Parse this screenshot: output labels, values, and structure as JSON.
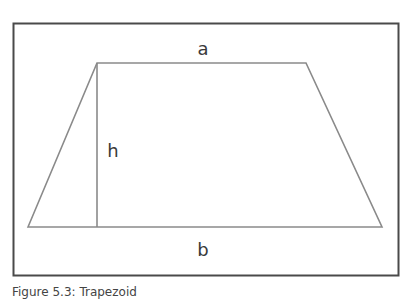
{
  "figure": {
    "title": "Trapezoid",
    "caption": "Figure 5.3: Trapezoid",
    "labels": {
      "top_side": "a",
      "height": "h",
      "bottom_side": "b"
    },
    "colors": {
      "frame": "#4a4a4a",
      "shape": "#8a8a8a",
      "text": "#3a3a3a"
    }
  }
}
